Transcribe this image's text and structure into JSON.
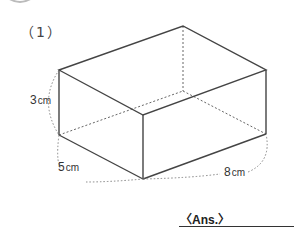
{
  "question": {
    "number": "（1）"
  },
  "figure": {
    "type": "rectangular prism",
    "dimensions": [
      {
        "value": "3",
        "unit": "cm",
        "edge": "height"
      },
      {
        "value": "5",
        "unit": "cm",
        "edge": "depth"
      },
      {
        "value": "8",
        "unit": "cm",
        "edge": "length"
      }
    ]
  },
  "answer": {
    "label": "〈Ans.〉",
    "value": ""
  }
}
